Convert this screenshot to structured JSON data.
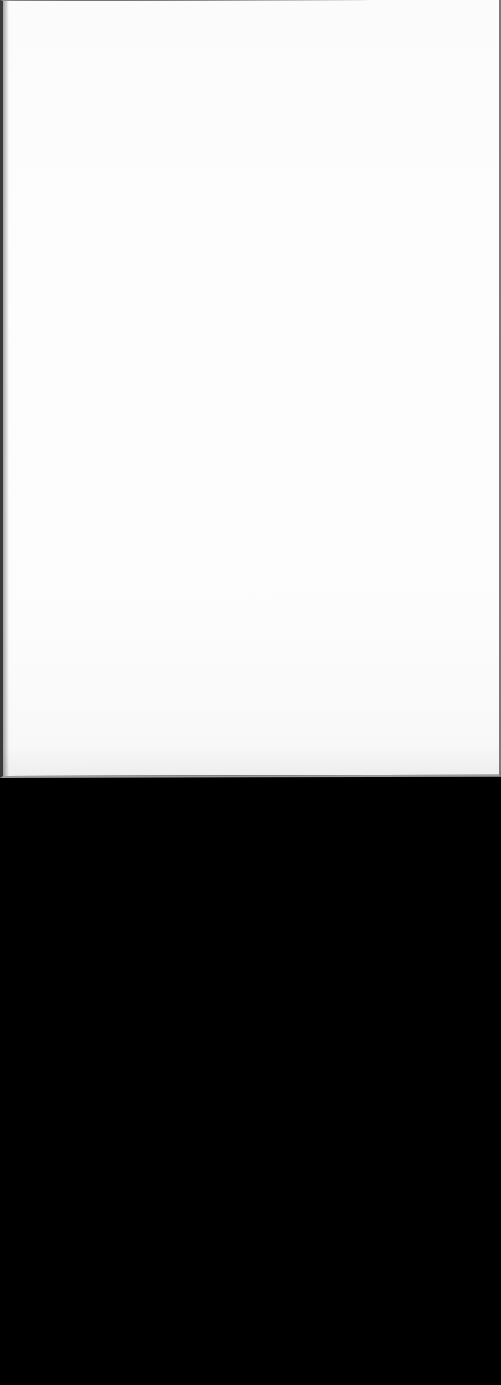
{
  "document": {
    "type": "scanned-blank-page",
    "page_text": "",
    "regions": [
      {
        "name": "paper-sheet",
        "color": "#fcfcfc"
      },
      {
        "name": "scanner-background",
        "color": "#000000"
      }
    ]
  },
  "colors": {
    "paper": "#fcfcfc",
    "background": "#000000",
    "left_edge": "#3a3a3a",
    "edge_border": "#8a8a8a"
  }
}
